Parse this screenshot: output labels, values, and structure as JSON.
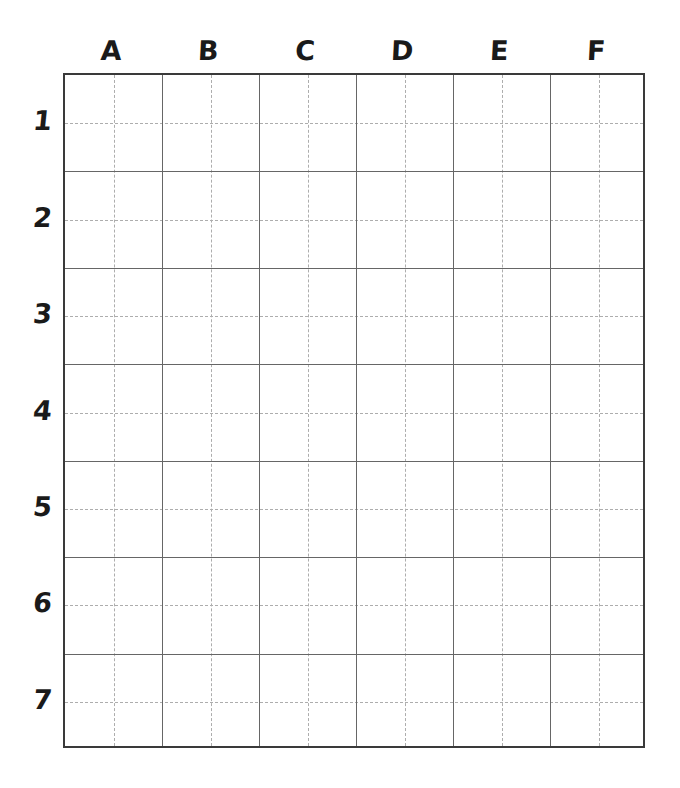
{
  "canvas": {
    "width": 680,
    "height": 788,
    "background": "#ffffff"
  },
  "grid": {
    "columns": 6,
    "rows": 7,
    "subdivisions_per_cell": 2,
    "left": 63,
    "top": 73,
    "width": 582,
    "height": 675,
    "cell_width": 97,
    "cell_height": 96.43,
    "border_color": "#3a3a3a",
    "major_line_color": "#666666",
    "minor_line_color": "#adadad",
    "minor_line_style": "dashed",
    "cells": []
  },
  "column_labels": [
    {
      "label": "A",
      "index": 0
    },
    {
      "label": "B",
      "index": 1
    },
    {
      "label": "C",
      "index": 2
    },
    {
      "label": "D",
      "index": 3
    },
    {
      "label": "E",
      "index": 4
    },
    {
      "label": "F",
      "index": 5
    }
  ],
  "row_labels": [
    {
      "label": "1",
      "index": 0
    },
    {
      "label": "2",
      "index": 1
    },
    {
      "label": "3",
      "index": 2
    },
    {
      "label": "4",
      "index": 3
    },
    {
      "label": "5",
      "index": 4
    },
    {
      "label": "6",
      "index": 5
    },
    {
      "label": "7",
      "index": 6
    }
  ]
}
